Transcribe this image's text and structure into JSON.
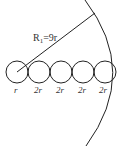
{
  "diagram": {
    "radius_label": "R",
    "radius_subscript": "1",
    "radius_value": "=9r",
    "circle_labels": [
      "r",
      "2r",
      "2r",
      "2r",
      "2r"
    ],
    "stroke_color": "#222222",
    "circles": [
      {
        "cx": 17,
        "cy": 72,
        "r": 11
      },
      {
        "cx": 39,
        "cy": 72,
        "r": 11
      },
      {
        "cx": 61,
        "cy": 72,
        "r": 11
      },
      {
        "cx": 83,
        "cy": 72,
        "r": 11
      },
      {
        "cx": 105,
        "cy": 72,
        "r": 11
      }
    ]
  }
}
